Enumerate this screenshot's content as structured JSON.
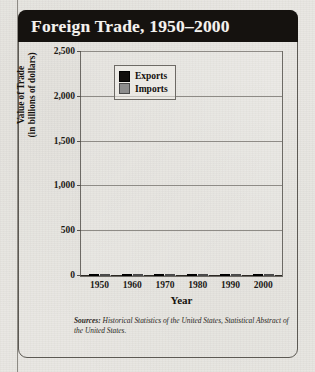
{
  "figure": {
    "title": "Foreign Trade, 1950–2000",
    "source_label": "Sources:",
    "source_text": "Historical Statistics of the United States, Statistical Abstract of the United States."
  },
  "legend": {
    "position": "top-left-inside",
    "entries": [
      {
        "label": "Exports",
        "color": "#100e0c",
        "swatch": "exports-swatch"
      },
      {
        "label": "Imports",
        "color": "#8d8d8d",
        "swatch": "imports-swatch"
      }
    ]
  },
  "chart_data": {
    "type": "bar",
    "title": "Foreign Trade, 1950–2000",
    "xlabel": "Year",
    "ylabel": "Value of Trade\n(in billions of dollars)",
    "ylabel_line1": "Value of Trade",
    "ylabel_line2": "(in billions of dollars)",
    "categories": [
      "1950",
      "1960",
      "1970",
      "1980",
      "1990",
      "2000"
    ],
    "series": [
      {
        "name": "Exports",
        "color": "#100e0c",
        "values": [
          10,
          20,
          43,
          225,
          390,
          1600
        ]
      },
      {
        "name": "Imports",
        "color": "#8d8d8d",
        "values": [
          9,
          15,
          40,
          245,
          495,
          2150
        ]
      }
    ],
    "ylim": [
      0,
      2500
    ],
    "ytick_values": [
      0,
      500,
      1000,
      1500,
      2000,
      2500
    ],
    "ytick_labels": [
      "0",
      "500",
      "1,000",
      "1,500",
      "2,000",
      "2,500"
    ],
    "grid": true,
    "grid_axis": "y",
    "legend_position": "upper left",
    "units": "billions of dollars"
  }
}
